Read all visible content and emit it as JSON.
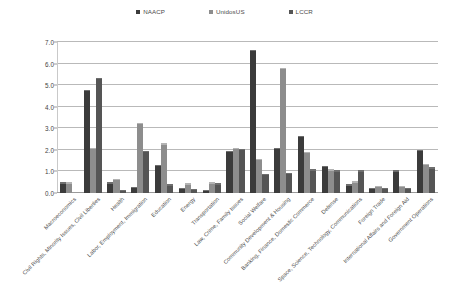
{
  "chart_data": {
    "type": "bar",
    "title": "",
    "subtitle": "",
    "xlabel": "",
    "ylabel": "",
    "ylim": [
      0.0,
      7.0
    ],
    "ytick_labels": [
      "0.0",
      "1.0",
      "2.0",
      "3.0",
      "4.0",
      "5.0",
      "6.0",
      "7.0"
    ],
    "ytick_values": [
      0.0,
      1.0,
      2.0,
      3.0,
      4.0,
      5.0,
      6.0,
      7.0
    ],
    "grid": true,
    "legend_position": "top-center",
    "categories": [
      "Macroeconomics",
      "Civil Rights, Minority Issues, Civil Liberties",
      "Health",
      "Labor, Employment, Immigration",
      "Education",
      "Energy",
      "Transportation",
      "Law, Crime, Family Issues",
      "Social Welfare",
      "Community Development & Housing",
      "Banking, Finance, Domestic Commerce",
      "Defense",
      "Space, Science, Technology, Communications",
      "Foreign Trade",
      "International Affairs and Foreign Aid",
      "Government Operations"
    ],
    "series": [
      {
        "name": "NAACP",
        "color": "#3b3b3b",
        "values": [
          0.45,
          4.75,
          0.45,
          0.25,
          1.25,
          0.2,
          0.1,
          1.9,
          6.6,
          2.05,
          2.6,
          1.2,
          0.35,
          0.2,
          1.0,
          1.95
        ]
      },
      {
        "name": "UnidosUS",
        "color": "#8d8d8d",
        "values": [
          0.45,
          2.05,
          0.6,
          3.2,
          2.25,
          0.4,
          0.45,
          2.05,
          1.55,
          5.75,
          1.85,
          1.05,
          0.5,
          0.3,
          0.3,
          1.3
        ]
      },
      {
        "name": "LCCR",
        "color": "#555555",
        "values": [
          0.0,
          5.3,
          0.1,
          1.9,
          0.35,
          0.15,
          0.4,
          2.0,
          0.85,
          0.9,
          1.05,
          1.0,
          1.0,
          0.2,
          0.2,
          1.15
        ]
      }
    ]
  },
  "legend": {
    "entries": [
      {
        "label": "NAACP",
        "color": "#3b3b3b"
      },
      {
        "label": "UnidosUS",
        "color": "#8d8d8d"
      },
      {
        "label": "LCCR",
        "color": "#555555"
      }
    ]
  }
}
